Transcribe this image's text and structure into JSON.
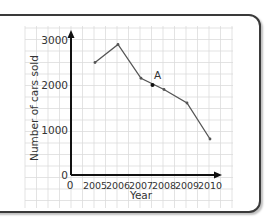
{
  "chart_data": {
    "type": "line",
    "title": "",
    "xlabel": "Year",
    "ylabel": "Number of cars sold",
    "categories": [
      "2005",
      "2006",
      "2007",
      "2008",
      "2009",
      "2010"
    ],
    "x_origin_label": "0",
    "values": [
      2500,
      2900,
      2150,
      1900,
      1600,
      800
    ],
    "ylim": [
      0,
      3000
    ],
    "yticks": [
      "0",
      "1000",
      "2000",
      "3000"
    ],
    "grid": true,
    "annotations": [
      {
        "label": "A",
        "x": 2007.5,
        "y": 2000
      }
    ],
    "colors": {
      "line": "#555555",
      "axis": "#111111",
      "grid": "#dcdcdc",
      "frame": "#3a3a3a"
    }
  }
}
